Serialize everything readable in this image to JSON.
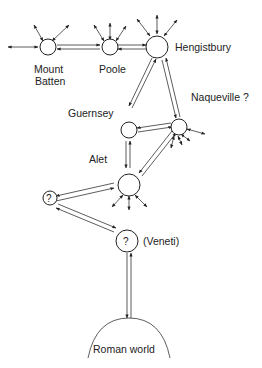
{
  "diagram": {
    "title": "",
    "nodes": [
      {
        "id": "mount-batten",
        "label_line1": "Mount",
        "label_line2": "Batten"
      },
      {
        "id": "poole",
        "label": "Poole"
      },
      {
        "id": "hengistbury",
        "label": "Hengistbury"
      },
      {
        "id": "guernsey",
        "label": "Guernsey"
      },
      {
        "id": "naqueville",
        "label": "Naqueville ?"
      },
      {
        "id": "alet",
        "label": "Alet"
      },
      {
        "id": "unknown-1",
        "label": "?"
      },
      {
        "id": "veneti",
        "label": "?",
        "side_label": "(Veneti)"
      },
      {
        "id": "roman-world",
        "label": "Roman world"
      }
    ],
    "edges": [
      {
        "from": "mount-batten",
        "to": "poole",
        "type": "two-way"
      },
      {
        "from": "poole",
        "to": "hengistbury",
        "type": "two-way"
      },
      {
        "from": "hengistbury",
        "to": "guernsey",
        "type": "two-way"
      },
      {
        "from": "hengistbury",
        "to": "naqueville",
        "type": "two-way"
      },
      {
        "from": "guernsey",
        "to": "naqueville",
        "type": "two-way"
      },
      {
        "from": "guernsey",
        "to": "alet",
        "type": "two-way"
      },
      {
        "from": "naqueville",
        "to": "alet",
        "type": "two-way"
      },
      {
        "from": "alet",
        "to": "unknown-1",
        "type": "two-way"
      },
      {
        "from": "unknown-1",
        "to": "veneti",
        "type": "two-way"
      },
      {
        "from": "veneti",
        "to": "roman-world",
        "type": "two-way"
      }
    ]
  }
}
